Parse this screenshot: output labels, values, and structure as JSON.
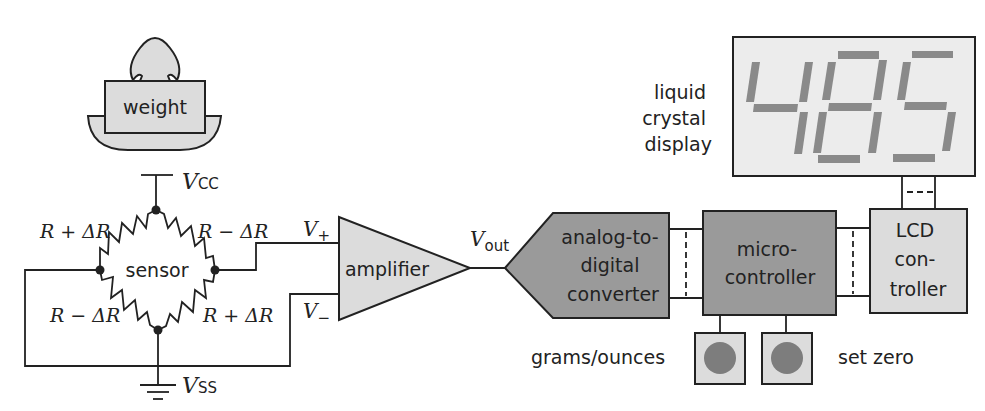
{
  "weight": {
    "label": "weight"
  },
  "bridge": {
    "center_label": "sensor",
    "vcc": {
      "main": "V",
      "sub": "CC"
    },
    "vss": {
      "main": "V",
      "sub": "SS"
    },
    "resistors": {
      "top_left": "R + ΔR",
      "top_right": "R − ΔR",
      "bottom_left": "R − ΔR",
      "bottom_right": "R + ΔR"
    }
  },
  "amplifier": {
    "label": "amplifier",
    "v_plus": {
      "main": "V",
      "sub": "+"
    },
    "v_minus": {
      "main": "V",
      "sub": "−"
    },
    "v_out": {
      "main": "V",
      "sub": "out"
    }
  },
  "adc": {
    "lines": [
      "analog-to-",
      "digital",
      "converter"
    ]
  },
  "microcontroller": {
    "lines": [
      "micro-",
      "controller"
    ]
  },
  "lcd_controller": {
    "lines": [
      "LCD",
      "con-",
      "troller"
    ]
  },
  "lcd_display": {
    "label_lines": [
      "liquid",
      "crystal",
      "display"
    ],
    "digits": "485"
  },
  "buttons": {
    "left_label": "grams/ounces",
    "right_label": "set zero"
  },
  "colors": {
    "light_fill": "#dcdcdc",
    "dark_fill": "#9a9a9a",
    "mid_fill": "#c9c9c9",
    "segment": "#8a8a8a",
    "button_dot": "#7d7d7d",
    "stroke": "#222222"
  }
}
